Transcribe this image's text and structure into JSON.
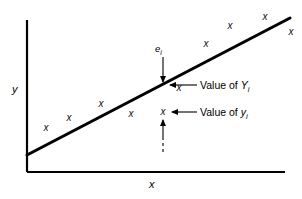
{
  "figure": {
    "kind": "regression-scatter-diagram",
    "background": "#ffffff",
    "ink": "#000000"
  },
  "axes": {
    "y_label": "y",
    "x_label": "x",
    "origin": [
      27,
      172
    ],
    "y_axis_top": 20,
    "x_axis_right": 285,
    "ticks": [],
    "grid": false
  },
  "annotations": {
    "residual": {
      "text_prefix": "e",
      "text_sub": "i",
      "arrow": "down-to-line"
    },
    "fitted": {
      "prefix": "Value of ",
      "symbol": "Y",
      "sub": "i",
      "arrow": "left-to-line"
    },
    "observed": {
      "prefix": "Value of ",
      "symbol": "y",
      "sub": "i",
      "arrow": "left-to-point"
    }
  },
  "chart_data": {
    "type": "scatter",
    "title": "",
    "xlabel": "x",
    "ylabel": "y",
    "grid": false,
    "legend": null,
    "marker_glyph": "x",
    "points_px": [
      [
        46,
        128
      ],
      [
        69,
        118
      ],
      [
        101,
        104
      ],
      [
        131,
        114
      ],
      [
        163,
        112
      ],
      [
        179,
        88
      ],
      [
        206,
        44
      ],
      [
        230,
        26
      ],
      [
        265,
        17
      ],
      [
        291,
        32
      ]
    ],
    "fit_line_px": {
      "x1": 27,
      "y1": 155,
      "x2": 290,
      "y2": 18
    },
    "callout_column_px": 163,
    "fitted_on_line_px": [
      163,
      85
    ],
    "observed_point_px": [
      163,
      112
    ]
  }
}
